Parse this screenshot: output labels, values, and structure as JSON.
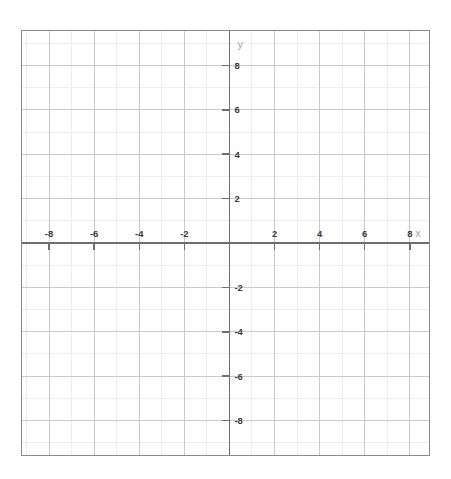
{
  "chart_data": {
    "type": "scatter",
    "title": "",
    "subtitle": "",
    "xlabel": "x",
    "ylabel": "y",
    "xlim": [
      -9.2,
      8.85
    ],
    "ylim": [
      -9.55,
      9.55
    ],
    "grid": true,
    "grid_major_step": 2,
    "grid_minor_step": 1,
    "legend": false,
    "legend_position": "none",
    "x_tick_values": [
      -8,
      -6,
      -4,
      -2,
      2,
      4,
      6,
      8
    ],
    "x_tick_labels": [
      "-8",
      "-6",
      "-4",
      "-2",
      "2",
      "4",
      "6",
      "8"
    ],
    "y_tick_values": [
      8,
      6,
      4,
      2,
      -2,
      -4,
      -6,
      -8
    ],
    "y_tick_labels": [
      "8",
      "6",
      "4",
      "2",
      "-2",
      "-4",
      "-6",
      "-8"
    ],
    "origin_label": "",
    "series": [],
    "annotations": []
  },
  "axes": {
    "x_name": "x",
    "y_name": "y"
  },
  "colors": {
    "border": "#8a8a8a",
    "axis": "#6e6e6e",
    "grid_major": "#c9c9c9",
    "grid_minor": "#ededed",
    "tick_label": "#3a3a3a",
    "axis_name": "#a5a5a5",
    "background": "#ffffff"
  }
}
